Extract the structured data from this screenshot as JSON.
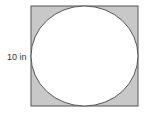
{
  "diagram": {
    "type": "geometry",
    "side_label": "10 in",
    "square": {
      "x": 31,
      "y": 6,
      "width": 107,
      "height": 100
    },
    "circle": {
      "cx": 84.5,
      "cy": 56,
      "rx": 53.5,
      "ry": 50
    },
    "colors": {
      "shaded_fill": "#c8c8c8",
      "stroke": "#555555",
      "circle_fill": "#ffffff",
      "label": "#333333"
    }
  }
}
